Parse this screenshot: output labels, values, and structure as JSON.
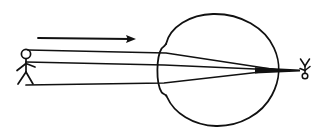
{
  "figure": {
    "title": "Eye optics diagram: light rays from an object forming an inverted retinal image",
    "caption": "",
    "background_color": "#ffffff",
    "ink_color": "#111111",
    "width": 319,
    "height": 138
  },
  "object_figure": {
    "name": "upright stick figure (object)",
    "label": "",
    "orientation": "upright",
    "head_center": [
      26,
      54
    ],
    "head_radius": 4.6,
    "body_bottom": [
      26,
      72
    ],
    "position_side": "left"
  },
  "image_figure": {
    "name": "inverted stick figure (retinal image)",
    "label": "",
    "orientation": "inverted",
    "head_center": [
      305,
      76
    ],
    "head_radius": 2.8,
    "body_top": [
      305,
      62
    ],
    "position_side": "right"
  },
  "direction_arrow": {
    "name": "light travel direction arrow",
    "label": "",
    "start": [
      38,
      38
    ],
    "end": [
      136,
      39
    ],
    "points": "right"
  },
  "eye": {
    "name": "eyeball outline",
    "label": "",
    "center": [
      218,
      70
    ],
    "radius_x": 60,
    "radius_y": 57,
    "cornea_side": "left"
  },
  "lens": {
    "name": "lens / cornea bulge",
    "label": "",
    "apex": [
      158,
      70
    ],
    "top_notch": [
      163,
      46
    ],
    "bottom_notch": [
      163,
      95
    ]
  },
  "focal_point": {
    "name": "convergence point on retina",
    "label": "",
    "position": [
      278,
      70
    ]
  },
  "rays": [
    {
      "name": "upper ray",
      "label": "",
      "origin": [
        28,
        50
      ],
      "lens_entry": [
        166,
        53
      ],
      "focus": [
        278,
        70
      ]
    },
    {
      "name": "central ray",
      "label": "",
      "origin": [
        26,
        62
      ],
      "lens_entry": [
        164,
        65
      ],
      "focus": [
        278,
        70
      ]
    },
    {
      "name": "lower ray",
      "label": "",
      "origin": [
        26,
        85
      ],
      "lens_entry": [
        164,
        83
      ],
      "focus": [
        278,
        70
      ]
    }
  ]
}
